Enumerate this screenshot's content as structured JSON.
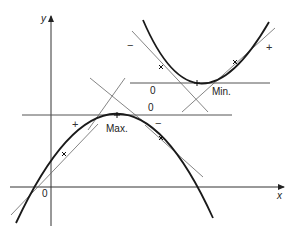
{
  "diagram": {
    "axes": {
      "x_label": "x",
      "y_label": "y",
      "origin_label": "0"
    },
    "max_curve": {
      "label": "Max.",
      "tangent_zero_label": "0",
      "left_sign": "+",
      "right_sign": "−"
    },
    "min_curve": {
      "label": "Min.",
      "tangent_zero_label": "0",
      "left_sign": "−",
      "right_sign": "+"
    },
    "colors": {
      "curve": "#1a1a1a",
      "tangent": "#555555",
      "axis": "#333333"
    }
  }
}
